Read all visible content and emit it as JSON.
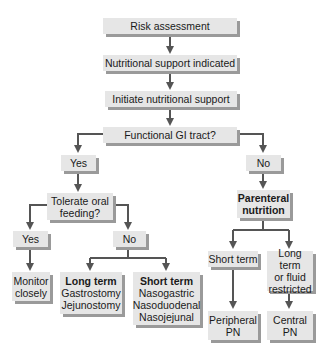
{
  "diagram": {
    "type": "flowchart",
    "colors": {
      "box_fill": "#e6e6e6",
      "box_shadow": "#9a9a9a",
      "connector": "#555555",
      "text": "#1a1a1a"
    },
    "nodes": {
      "risk": {
        "label": "Risk assessment"
      },
      "indicated": {
        "label": "Nutritional support indicated"
      },
      "initiate": {
        "label": "Initiate nutritional support"
      },
      "gi": {
        "label": "Functional GI tract?"
      },
      "gi_yes": {
        "label": "Yes"
      },
      "gi_no": {
        "label": "No"
      },
      "oral": {
        "line1": "Tolerate oral",
        "line2": "feeding?"
      },
      "parenteral": {
        "line1": "Parenteral",
        "line2": "nutrition"
      },
      "oral_yes": {
        "label": "Yes"
      },
      "oral_no": {
        "label": "No"
      },
      "monitor": {
        "line1": "Monitor",
        "line2": "closely"
      },
      "long_term_enteral": {
        "title": "Long term",
        "items": [
          "Gastrostomy",
          "Jejunostomy"
        ]
      },
      "short_term_enteral": {
        "title": "Short term",
        "items": [
          "Nasogastric",
          "Nasoduodenal",
          "Nasojejunal"
        ]
      },
      "pn_short": {
        "label": "Short term"
      },
      "pn_long": {
        "line1": "Long term",
        "line2": "or fluid",
        "line3": "restricted"
      },
      "peripheral": {
        "line1": "Peripheral",
        "line2": "PN"
      },
      "central": {
        "line1": "Central",
        "line2": "PN"
      }
    }
  }
}
